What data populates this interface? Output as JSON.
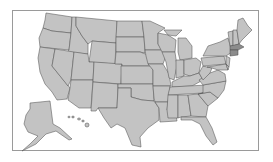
{
  "map": {
    "type": "choropleth-outline",
    "region": "United States",
    "colors": {
      "background": "#ffffff",
      "frame_border": "#9a9a9a",
      "state_fill": "#c3c3c3",
      "state_border": "#555555",
      "highlight_fill": "#8c8c8c"
    },
    "insets": [
      "Alaska",
      "Hawaii"
    ],
    "labels": []
  }
}
